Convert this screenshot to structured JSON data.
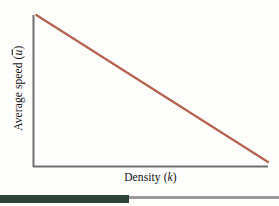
{
  "figure": {
    "background_color": "#fdfdfc",
    "axis_color": "#6e6e6e",
    "line_color": "#b5634f",
    "footer_band_color": "#2e4438",
    "footer_rule_color": "#9a9a9a"
  },
  "labels": {
    "y_axis_prefix": "Average speed (",
    "y_axis_symbol": "u",
    "y_axis_suffix": ")",
    "x_axis_prefix": "Density (",
    "x_axis_symbol": "k",
    "x_axis_suffix": ")"
  },
  "chart_data": {
    "type": "line",
    "title": "",
    "subtitle": "",
    "xlabel": "Density (k)",
    "ylabel": "Average speed (ū)",
    "grid": false,
    "legend": null,
    "xlim": [
      0,
      1
    ],
    "ylim": [
      0,
      1
    ],
    "xticks": [],
    "yticks": [],
    "annotations": [],
    "series": [
      {
        "name": "speed-density relationship",
        "color": "#b5634f",
        "x": [
          0.014,
          1.0
        ],
        "y": [
          1.0,
          0.033
        ],
        "description": "Linear decreasing speed-density curve (Greenshields model): average speed falls steadily as density increases."
      }
    ]
  }
}
